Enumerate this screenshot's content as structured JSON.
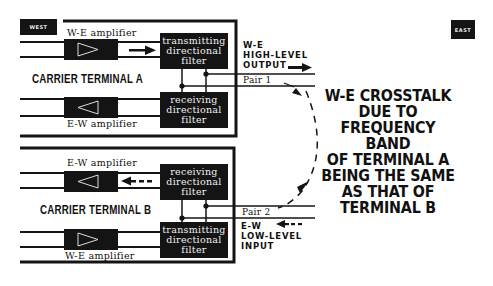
{
  "labels": {
    "west": "WEST",
    "east": "EAST"
  },
  "terminal_a": {
    "title": "CARRIER TERMINAL A",
    "we_amplifier": "W-E amplifier",
    "ew_amplifier": "E-W amplifier",
    "transmitting_filter": [
      "transmitting",
      "directional",
      "filter"
    ],
    "receiving_filter": [
      "receiving",
      "directional",
      "filter"
    ]
  },
  "terminal_b": {
    "title": "CARRIER TERMINAL B",
    "ew_amplifier": "E-W amplifier",
    "we_amplifier": "W-E amplifier",
    "receiving_filter": [
      "receiving",
      "directional",
      "filter"
    ],
    "transmitting_filter": [
      "transmitting",
      "directional",
      "filter"
    ]
  },
  "lines": {
    "pair1": "Pair 1",
    "pair2": "Pair 2",
    "high_level_output": [
      "W-E",
      "HIGH-LEVEL",
      "OUTPUT"
    ],
    "low_level_input": [
      "E-W",
      "LOW-LEVEL",
      "INPUT"
    ]
  },
  "caption": [
    "W-E CROSSTALK",
    "DUE TO",
    "FREQUENCY BAND",
    "OF TERMINAL A",
    "BEING THE SAME",
    "AS THAT OF",
    "TERMINAL B"
  ],
  "colors": {
    "ink": "#141414",
    "paper": "#ffffff"
  }
}
